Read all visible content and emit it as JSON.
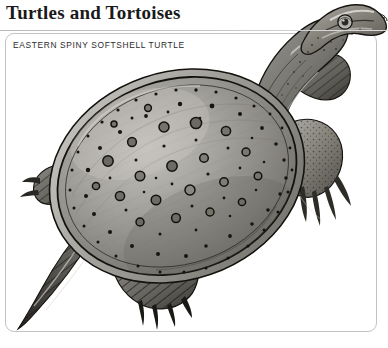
{
  "page": {
    "title": "Turtles and Tortoises",
    "background_color": "#ffffff",
    "rule_color": "#c3c3c3"
  },
  "caption": {
    "species_label": "EASTERN SPINY SOFTSHELL TURTLE",
    "frame_border_color": "#c3c3c3",
    "text_color": "#2b2b2b"
  },
  "illustration": {
    "name": "eastern-spiny-softshell-turtle-illustration",
    "subject": "Eastern Spiny Softshell Turtle",
    "view": "dorsal",
    "style": "grayscale-engraving",
    "palette": {
      "carapace_light": "#b8b6b0",
      "carapace_mid": "#8f8d88",
      "carapace_dark": "#5d5c58",
      "outline": "#15140f",
      "limb_dark": "#2a2824",
      "highlight": "#d8d6d0"
    },
    "parts": [
      "carapace",
      "head",
      "neck",
      "eye",
      "snout",
      "front-left-limb",
      "front-right-limb",
      "hind-left-limb",
      "hind-right-limb",
      "tail"
    ],
    "carapace_spot_count": 96
  }
}
